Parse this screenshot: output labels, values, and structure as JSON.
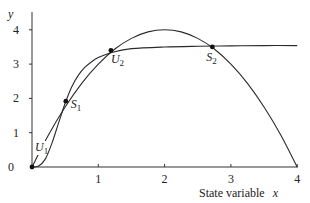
{
  "chart_data": {
    "type": "line",
    "title": "",
    "xlabel": "State variable x",
    "xlabel_text": "State variable",
    "xlabel_var": "x",
    "ylabel": "y",
    "xlim": [
      0,
      4
    ],
    "ylim": [
      0,
      4.45
    ],
    "grid": false,
    "legend": null,
    "x_ticks": [
      {
        "value": 0,
        "label": "0"
      },
      {
        "value": 1,
        "label": "1"
      },
      {
        "value": 2,
        "label": "2"
      },
      {
        "value": 3,
        "label": "3"
      },
      {
        "value": 4,
        "label": "4"
      }
    ],
    "y_ticks": [
      {
        "value": 1,
        "label": "1"
      },
      {
        "value": 2,
        "label": "2"
      },
      {
        "value": 3,
        "label": "3"
      },
      {
        "value": 4,
        "label": "4"
      }
    ],
    "origin_label": "0",
    "series": [
      {
        "name": "parabola",
        "description": "y = x(4 - x)",
        "x": [
          0,
          0.25,
          0.5,
          0.75,
          1.0,
          1.25,
          1.5,
          1.75,
          2.0,
          2.25,
          2.5,
          2.75,
          3.0,
          3.25,
          3.5,
          3.75,
          4.0
        ],
        "values": [
          0,
          0.94,
          1.75,
          2.44,
          3.0,
          3.44,
          3.75,
          3.94,
          4.0,
          3.94,
          3.75,
          3.44,
          3.0,
          2.44,
          1.75,
          0.94,
          0
        ]
      },
      {
        "name": "sigmoid",
        "description": "Hill-type saturating curve, plateau ~3.55",
        "x": [
          0,
          0.1,
          0.2,
          0.3,
          0.4,
          0.5,
          0.6,
          0.7,
          0.8,
          0.9,
          1.0,
          1.2,
          1.5,
          2.0,
          2.5,
          3.0,
          3.5,
          4.0
        ],
        "values": [
          0,
          0.03,
          0.23,
          0.69,
          1.28,
          1.86,
          2.34,
          2.68,
          2.91,
          3.07,
          3.19,
          3.34,
          3.45,
          3.5,
          3.52,
          3.53,
          3.54,
          3.54
        ]
      }
    ],
    "points": [
      {
        "label": "U",
        "sub": "1",
        "x": 0.0,
        "y": 0.0,
        "type": "unstable"
      },
      {
        "label": "S",
        "sub": "1",
        "x": 0.51,
        "y": 1.92,
        "type": "stable"
      },
      {
        "label": "U",
        "sub": "2",
        "x": 1.19,
        "y": 3.4,
        "type": "unstable"
      },
      {
        "label": "S",
        "sub": "2",
        "x": 2.72,
        "y": 3.5,
        "type": "stable"
      }
    ]
  }
}
